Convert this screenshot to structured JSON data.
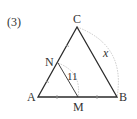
{
  "problem_label": "(3)",
  "vertices": {
    "A": {
      "label": "A",
      "x": 38,
      "y": 97
    },
    "B": {
      "label": "B",
      "x": 117,
      "y": 97
    },
    "C": {
      "label": "C",
      "x": 77,
      "y": 27
    },
    "N": {
      "label": "N",
      "x": 58,
      "y": 63
    },
    "M": {
      "label": "M",
      "x": 78,
      "y": 97
    }
  },
  "segment_NM_label": "11",
  "side_CB_label": "x",
  "colors": {
    "line": "#2b2b2b",
    "arc": "#bdbdbd",
    "text": "#333333"
  }
}
